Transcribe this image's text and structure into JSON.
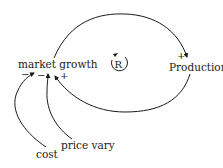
{
  "diagram": {
    "type": "causal-loop",
    "nodes": [
      {
        "id": "market_growth",
        "label": "market growth"
      },
      {
        "id": "production",
        "label": "Production"
      },
      {
        "id": "cost",
        "label": "cost"
      },
      {
        "id": "price_vary",
        "label": "price vary"
      }
    ],
    "edges": [
      {
        "from": "market_growth",
        "to": "production",
        "polarity": "+"
      },
      {
        "from": "production",
        "to": "market_growth",
        "polarity": "+"
      },
      {
        "from": "cost",
        "to": "market_growth",
        "polarity": "−"
      },
      {
        "from": "price_vary",
        "to": "market_growth",
        "polarity": "−"
      }
    ],
    "loop": {
      "label": "R",
      "type": "reinforcing",
      "direction": "clockwise"
    },
    "colors": {
      "stroke": "#1a1a1a",
      "background": "#ffffff"
    }
  }
}
